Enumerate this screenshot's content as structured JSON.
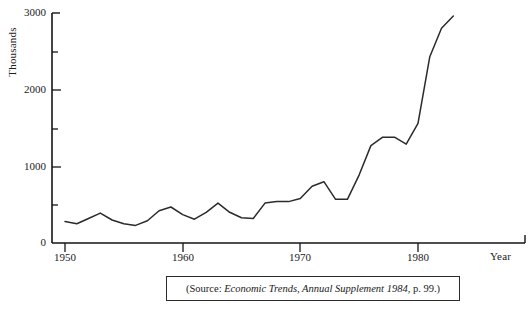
{
  "figure": {
    "caption_prefix": "(Source: ",
    "caption_italic": "Economic Trends, Annual Supplement 1984",
    "caption_suffix": ", p. 99.)",
    "line_color": "#2b2b2b",
    "axis_color": "#151515",
    "background_color": "#ffffff"
  },
  "chart_data": {
    "type": "line",
    "title": "",
    "subtitle": "",
    "xlabel": "Year",
    "ylabel": "Thousands",
    "xlim": [
      1950,
      1990
    ],
    "ylim": [
      0,
      3000
    ],
    "grid": false,
    "legend": null,
    "x_major_ticks": [
      1950,
      1960,
      1970,
      1980
    ],
    "x_major_tick_labels": [
      "1950",
      "1960",
      "1970",
      "1980"
    ],
    "x_minor_ticks": [
      1955,
      1965,
      1975,
      1985
    ],
    "y_major_ticks": [
      0,
      1000,
      2000,
      3000
    ],
    "y_major_tick_labels": [
      "0",
      "1000",
      "2000",
      "3000"
    ],
    "y_minor_ticks": [
      500,
      1500,
      2500
    ],
    "series": [
      {
        "name": "Unemployment",
        "x": [
          1950,
          1951,
          1952,
          1953,
          1954,
          1955,
          1956,
          1957,
          1958,
          1959,
          1960,
          1961,
          1962,
          1963,
          1964,
          1965,
          1966,
          1967,
          1968,
          1969,
          1970,
          1971,
          1972,
          1973,
          1974,
          1975,
          1976,
          1977,
          1978,
          1979,
          1980,
          1981,
          1982,
          1983
        ],
        "values": [
          280,
          250,
          320,
          390,
          300,
          250,
          230,
          290,
          420,
          470,
          370,
          310,
          400,
          520,
          400,
          330,
          320,
          520,
          540,
          540,
          580,
          740,
          800,
          570,
          570,
          890,
          1270,
          1380,
          1380,
          1290,
          1560,
          2430,
          2800,
          2960
        ]
      }
    ]
  }
}
